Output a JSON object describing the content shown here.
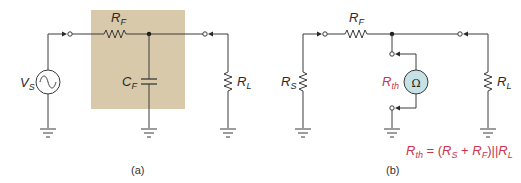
{
  "colors": {
    "wire": "#3a3a3a",
    "filter_box": "#d8c9ab",
    "ohmmeter_fill": "#c7e2e4",
    "highlight_text": "#c8364e"
  },
  "panel_a": {
    "caption": "(a)",
    "source": {
      "label_main": "V",
      "label_sub": "S",
      "icon": "ac-source-icon"
    },
    "filter_resistor": {
      "label_main": "R",
      "label_sub": "F"
    },
    "filter_capacitor": {
      "label_main": "C",
      "label_sub": "F"
    },
    "load_resistor": {
      "label_main": "R",
      "label_sub": "L"
    }
  },
  "panel_b": {
    "caption": "(b)",
    "source_resistor": {
      "label_main": "R",
      "label_sub": "S"
    },
    "filter_resistor": {
      "label_main": "R",
      "label_sub": "F"
    },
    "ohmmeter": {
      "symbol": "Ω",
      "label_main": "R",
      "label_sub": "th"
    },
    "load_resistor": {
      "label_main": "R",
      "label_sub": "L"
    },
    "formula": {
      "lhs_main": "R",
      "lhs_sub": "th",
      "eq": " = (",
      "t1_main": "R",
      "t1_sub": "S",
      "plus": " + ",
      "t2_main": "R",
      "t2_sub": "F",
      "par": ")||",
      "t3_main": "R",
      "t3_sub": "L"
    }
  }
}
